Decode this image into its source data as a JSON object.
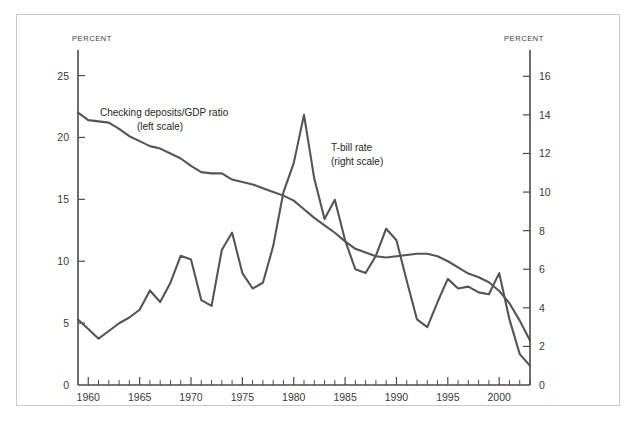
{
  "chart_data": {
    "type": "line",
    "title": "",
    "xlabel": "",
    "grid": false,
    "xlim": [
      1959,
      2003
    ],
    "x_ticks_major": [
      1960,
      1965,
      1970,
      1975,
      1980,
      1985,
      1990,
      1995,
      2000
    ],
    "x_tick_labels": [
      "1960",
      "1965",
      "1970",
      "1975",
      "1980",
      "1985",
      "1990",
      "1995",
      "2000"
    ],
    "left_axis": {
      "title": "PERCENT",
      "ylim": [
        0,
        26.5
      ],
      "ticks": [
        0,
        5,
        10,
        15,
        20,
        25
      ],
      "tick_labels": [
        "0",
        "5",
        "10",
        "15",
        "20",
        "25"
      ]
    },
    "right_axis": {
      "title": "PERCENT",
      "ylim": [
        0,
        17
      ],
      "ticks": [
        0,
        2,
        4,
        6,
        8,
        10,
        12,
        14,
        16
      ],
      "tick_labels": [
        "0",
        "2",
        "4",
        "6",
        "8",
        "10",
        "12",
        "14",
        "16"
      ]
    },
    "line_color": "#555555",
    "x": [
      1959,
      1960,
      1961,
      1962,
      1963,
      1964,
      1965,
      1966,
      1967,
      1968,
      1969,
      1970,
      1971,
      1972,
      1973,
      1974,
      1975,
      1976,
      1977,
      1978,
      1979,
      1980,
      1981,
      1982,
      1983,
      1984,
      1985,
      1986,
      1987,
      1988,
      1989,
      1990,
      1991,
      1992,
      1993,
      1994,
      1995,
      1996,
      1997,
      1998,
      1999,
      2000,
      2001,
      2002,
      2003
    ],
    "series": [
      {
        "name": "Checking deposits/GDP ratio",
        "scale": "left",
        "label_line1": "Checking deposits/GDP ratio",
        "label_line2": "(left scale)",
        "values": [
          22.0,
          21.4,
          21.3,
          21.2,
          20.7,
          20.1,
          19.7,
          19.3,
          19.1,
          18.7,
          18.3,
          17.7,
          17.2,
          17.1,
          17.1,
          16.6,
          16.4,
          16.2,
          15.9,
          15.6,
          15.3,
          14.9,
          14.2,
          13.5,
          12.9,
          12.3,
          11.6,
          11.0,
          10.7,
          10.4,
          10.3,
          10.4,
          10.5,
          10.6,
          10.6,
          10.4,
          10.0,
          9.5,
          9.0,
          8.7,
          8.3,
          7.6,
          6.6,
          5.2,
          3.6
        ]
      },
      {
        "name": "T-bill rate",
        "scale": "right",
        "label_line1": "T-bill rate",
        "label_line2": "(right scale)",
        "values": [
          3.4,
          2.9,
          2.4,
          2.8,
          3.2,
          3.5,
          3.9,
          4.9,
          4.3,
          5.3,
          6.7,
          6.5,
          4.4,
          4.1,
          7.0,
          7.9,
          5.8,
          5.0,
          5.3,
          7.2,
          10.0,
          11.5,
          14.0,
          10.7,
          8.6,
          9.6,
          7.5,
          6.0,
          5.8,
          6.7,
          8.1,
          7.5,
          5.4,
          3.4,
          3.0,
          4.3,
          5.5,
          5.0,
          5.1,
          4.8,
          4.7,
          5.8,
          3.4,
          1.6,
          1.0
        ]
      }
    ]
  }
}
